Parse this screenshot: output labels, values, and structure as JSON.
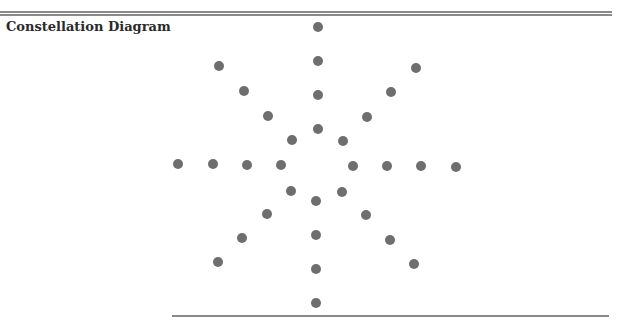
{
  "title": "Constellation Diagram",
  "colors": {
    "dot": "#6e6e6e",
    "rule": "#8a8a8a",
    "title": "#2a2a2a"
  },
  "points": [
    {
      "x": 318,
      "y": 27
    },
    {
      "x": 318,
      "y": 61
    },
    {
      "x": 318,
      "y": 95
    },
    {
      "x": 318,
      "y": 129
    },
    {
      "x": 219,
      "y": 66
    },
    {
      "x": 244,
      "y": 91
    },
    {
      "x": 268,
      "y": 116
    },
    {
      "x": 292,
      "y": 140
    },
    {
      "x": 416,
      "y": 68
    },
    {
      "x": 391,
      "y": 92
    },
    {
      "x": 367,
      "y": 117
    },
    {
      "x": 343,
      "y": 141
    },
    {
      "x": 178,
      "y": 164
    },
    {
      "x": 213,
      "y": 164
    },
    {
      "x": 247,
      "y": 165
    },
    {
      "x": 281,
      "y": 165
    },
    {
      "x": 353,
      "y": 166
    },
    {
      "x": 387,
      "y": 166
    },
    {
      "x": 421,
      "y": 166
    },
    {
      "x": 456,
      "y": 167
    },
    {
      "x": 291,
      "y": 191
    },
    {
      "x": 267,
      "y": 214
    },
    {
      "x": 242,
      "y": 238
    },
    {
      "x": 218,
      "y": 262
    },
    {
      "x": 342,
      "y": 192
    },
    {
      "x": 366,
      "y": 215
    },
    {
      "x": 390,
      "y": 240
    },
    {
      "x": 414,
      "y": 264
    },
    {
      "x": 316,
      "y": 201
    },
    {
      "x": 316,
      "y": 235
    },
    {
      "x": 316,
      "y": 269
    },
    {
      "x": 316,
      "y": 303
    }
  ]
}
